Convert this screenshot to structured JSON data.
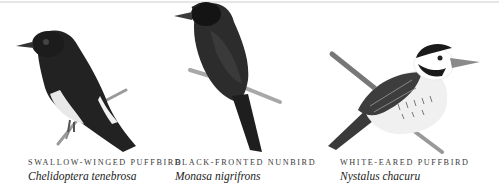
{
  "birds": [
    {
      "common_name": "Swallow-winged Puffbird",
      "scientific_name": "Chelidoptera tenebrosa",
      "illustration": "swallow-winged-puffbird-illustration"
    },
    {
      "common_name": "Black-fronted Nunbird",
      "scientific_name": "Monasa nigrifrons",
      "illustration": "black-fronted-nunbird-illustration"
    },
    {
      "common_name": "White-eared Puffbird",
      "scientific_name": "Nystalus chacuru",
      "illustration": "white-eared-puffbird-illustration"
    }
  ],
  "colors": {
    "background": "#ffffff",
    "text": "#2b2b2b",
    "divider": "#e6e6e6"
  }
}
